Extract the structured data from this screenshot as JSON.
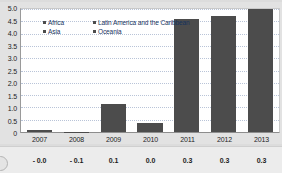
{
  "chart_data": {
    "type": "bar",
    "title": "",
    "subtitle": "",
    "xlabel": "",
    "ylabel": "",
    "categories": [
      "2007",
      "2008",
      "2009",
      "2010",
      "2011",
      "2012",
      "2013"
    ],
    "ylim": [
      0,
      5.0
    ],
    "ytick_labels": [
      "0",
      "0.5",
      "1.0",
      "1.5",
      "2.0",
      "2.5",
      "3.0",
      "3.5",
      "4.0",
      "4.5",
      "5.0"
    ],
    "ytick_values": [
      0,
      0.5,
      1.0,
      1.5,
      2.0,
      2.5,
      3.0,
      3.5,
      4.0,
      4.5,
      5.0
    ],
    "grid": true,
    "stacked": true,
    "legend_position": "top-left",
    "legend": [
      {
        "name": "Africa",
        "color": "#4c4c4c"
      },
      {
        "name": "Latin America and the Caribbean",
        "color": "#4c4c4c"
      },
      {
        "name": "Asia",
        "color": "#4c4c4c"
      },
      {
        "name": "Oceania",
        "color": "#4c4c4c"
      }
    ],
    "series": [
      {
        "name": "Africa",
        "color": "#4c4c4c",
        "values": [
          0.1,
          0.02,
          1.12,
          0.36,
          4.58,
          4.7,
          5.0
        ]
      }
    ],
    "totals": [
      0.1,
      0.02,
      1.12,
      0.36,
      4.58,
      4.7,
      5.0
    ],
    "annotation_row": {
      "values": [
        "- 0.0",
        "- 0.1",
        "0.1",
        "0.0",
        "0.3",
        "0.3",
        "0.3"
      ]
    }
  },
  "colors": {
    "bar": "#4c4c4c",
    "plot_background": "#ffffff",
    "figure_background": "#e2e2e2",
    "gridline": "#b9c4d8",
    "axis": "#8d8d8d",
    "legend_text": "#15325e",
    "tick_text": "#1d1d1d"
  }
}
